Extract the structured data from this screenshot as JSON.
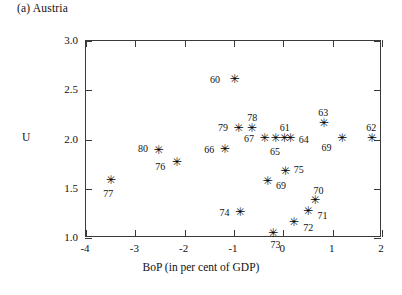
{
  "panel": {
    "title": "(a) Austria"
  },
  "axes": {
    "y_title": "U",
    "x_title": "BoP (in per cent of GDP)",
    "y_ticks": [
      "3.0",
      "2.5",
      "2.0",
      "1.5",
      "1.0"
    ],
    "x_ticks": [
      "-4",
      "-3",
      "-2",
      "-1",
      "0",
      "1",
      "2"
    ]
  },
  "chart_data": {
    "type": "scatter",
    "title": "(a) Austria",
    "xlabel": "BoP (in per cent of GDP)",
    "ylabel": "U",
    "xlim": [
      -4,
      2
    ],
    "ylim": [
      1.0,
      3.0
    ],
    "xticks": [
      -4,
      -3,
      -2,
      -1,
      0,
      1,
      2
    ],
    "yticks": [
      1.0,
      1.5,
      2.0,
      2.5,
      3.0
    ],
    "grid": false,
    "legend": "none",
    "marker": "asterisk",
    "point_labels": "two-digit year",
    "points": [
      {
        "label": "60",
        "x": -1.0,
        "y": 2.61,
        "label_dx": -19,
        "label_dy": 0
      },
      {
        "label": "79",
        "x": -0.92,
        "y": 2.11,
        "label_dx": -15,
        "label_dy": -2
      },
      {
        "label": "78",
        "x": -0.65,
        "y": 2.11,
        "label_dx": 1,
        "label_dy": -12
      },
      {
        "label": "63",
        "x": 0.81,
        "y": 2.16,
        "label_dx": 0,
        "label_dy": -12
      },
      {
        "label": "67",
        "x": -0.39,
        "y": 2.01,
        "label_dx": -15,
        "label_dy": -1
      },
      {
        "label": "65",
        "x": -0.17,
        "y": 2.01,
        "label_dx": 0,
        "label_dy": 12
      },
      {
        "label": "61",
        "x": 0.01,
        "y": 2.01,
        "label_dx": 1,
        "label_dy": -12
      },
      {
        "label": "64",
        "x": 0.13,
        "y": 2.01,
        "label_dx": 14,
        "label_dy": 0
      },
      {
        "label": "69",
        "x": 1.18,
        "y": 2.01,
        "label_dx": -15,
        "label_dy": 8
      },
      {
        "label": "62",
        "x": 1.78,
        "y": 2.01,
        "label_dx": 0,
        "label_dy": -12
      },
      {
        "label": "80",
        "x": -2.54,
        "y": 1.89,
        "label_dx": -15,
        "label_dy": -2
      },
      {
        "label": "66",
        "x": -1.2,
        "y": 1.9,
        "label_dx": -15,
        "label_dy": 0
      },
      {
        "label": "76",
        "x": -2.17,
        "y": 1.77,
        "label_dx": -16,
        "label_dy": 4
      },
      {
        "label": "75",
        "x": 0.03,
        "y": 1.68,
        "label_dx": 14,
        "label_dy": -2
      },
      {
        "label": "69",
        "x": -0.33,
        "y": 1.57,
        "label_dx": 14,
        "label_dy": 3
      },
      {
        "label": "77",
        "x": -3.51,
        "y": 1.58,
        "label_dx": -2,
        "label_dy": 12
      },
      {
        "label": "70",
        "x": 0.63,
        "y": 1.38,
        "label_dx": 4,
        "label_dy": -11
      },
      {
        "label": "71",
        "x": 0.49,
        "y": 1.27,
        "label_dx": 15,
        "label_dy": 4
      },
      {
        "label": "74",
        "x": -0.89,
        "y": 1.26,
        "label_dx": -15,
        "label_dy": 0
      },
      {
        "label": "72",
        "x": 0.2,
        "y": 1.16,
        "label_dx": 15,
        "label_dy": 5
      },
      {
        "label": "73",
        "x": -0.22,
        "y": 1.05,
        "label_dx": 3,
        "label_dy": 11
      }
    ]
  },
  "style": {
    "frame_color": "#3a3a3a",
    "marker_color": "#000000",
    "text_color": "#111111",
    "background": "#ffffff",
    "marker_glyph": "✳"
  },
  "geometry": {
    "plot_left": 85,
    "plot_top": 40,
    "plot_width": 296,
    "plot_height": 197
  }
}
